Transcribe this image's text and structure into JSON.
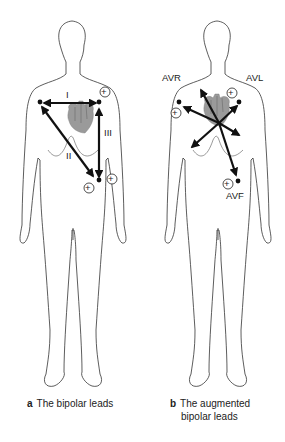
{
  "panels": [
    {
      "id": "a",
      "caption_letter": "a",
      "caption_text": "The bipolar leads",
      "lead_labels": [
        "I",
        "II",
        "III"
      ]
    },
    {
      "id": "b",
      "caption_letter": "b",
      "caption_text_line1": "The augmented",
      "caption_text_line2": "bipolar leads",
      "lead_labels": [
        "AVR",
        "AVL",
        "AVF"
      ]
    }
  ],
  "symbols": {
    "positive_electrode": "+"
  },
  "colors": {
    "outline": "#333333",
    "arrow": "#111111",
    "heart": "#9a9a9a"
  }
}
